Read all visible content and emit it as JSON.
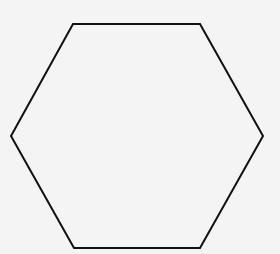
{
  "diagram": {
    "shape": "hexagon",
    "background": "#f4f4f4",
    "fill": "none",
    "stroke": "#111111",
    "stroke_width": 2,
    "vertices": [
      [
        73,
        24
      ],
      [
        200,
        24
      ],
      [
        263,
        136
      ],
      [
        200,
        248
      ],
      [
        74,
        248
      ],
      [
        11,
        136
      ]
    ]
  }
}
